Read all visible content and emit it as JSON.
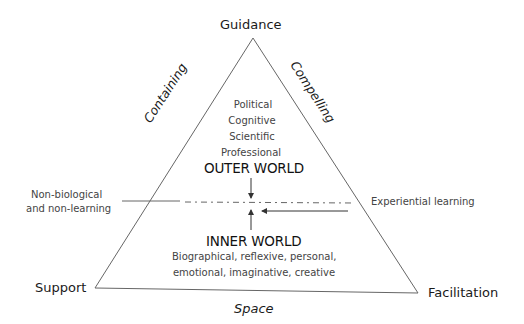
{
  "corners": {
    "top": "Guidance",
    "bottom_left": "Support",
    "bottom_right": "Facilitation"
  },
  "sides": {
    "left": "Containing",
    "right": "Compelling",
    "bottom": "Space"
  },
  "outer_world": {
    "title": "OUTER WORLD",
    "items": [
      "Political",
      "Cognitive",
      "Scientific",
      "Professional"
    ]
  },
  "inner_world": {
    "title": "INNER WORLD",
    "description_lines": [
      "Biographical, reflexive, personal,",
      "emotional, imaginative, creative"
    ]
  },
  "annotations": {
    "left_line1": "Non-biological",
    "left_line2": "and non-learning",
    "right": "Experiential learning"
  },
  "colors": {
    "line": "#555555",
    "text_dark": "#1a1a1a",
    "text_grey": "#444444"
  }
}
